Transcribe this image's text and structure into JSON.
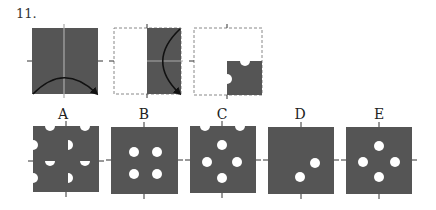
{
  "question": {
    "number": "11.",
    "steps": [
      {
        "id": "fold-1",
        "description": "square folded along vertical axis, arc arrow bottom"
      },
      {
        "id": "fold-2",
        "description": "right half folded along horizontal axis, arc arrow"
      },
      {
        "id": "punched",
        "description": "quarter with semicircle notches on top and left edges"
      }
    ],
    "options": [
      {
        "label": "A"
      },
      {
        "label": "B"
      },
      {
        "label": "C"
      },
      {
        "label": "D"
      },
      {
        "label": "E"
      }
    ]
  },
  "colors": {
    "fill": "#555555",
    "hole": "#ffffff",
    "axis": "#aaaaaa",
    "dash": "#888888"
  }
}
